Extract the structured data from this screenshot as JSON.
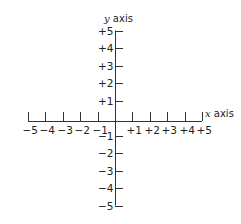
{
  "diagram": {
    "type": "cartesian-axes",
    "x_axis": {
      "label_var": "x",
      "label_rest": " axis",
      "ticks": [
        -5,
        -4,
        -3,
        -2,
        -1,
        1,
        2,
        3,
        4,
        5
      ],
      "tick_labels": [
        "−5",
        "−4",
        "−3",
        "−2",
        "−1",
        "+1",
        "+2",
        "+3",
        "+4",
        "+5"
      ]
    },
    "y_axis": {
      "label_var": "y",
      "label_rest": " axis",
      "ticks": [
        5,
        4,
        3,
        2,
        1,
        -1,
        -2,
        -3,
        -4,
        -5
      ],
      "tick_labels": [
        "+5",
        "+4",
        "+3",
        "+2",
        "+1",
        "−1",
        "−2",
        "−3",
        "−4",
        "−5"
      ]
    },
    "colors": {
      "line": "#333333",
      "text": "#222222",
      "background": "#ffffff"
    }
  }
}
